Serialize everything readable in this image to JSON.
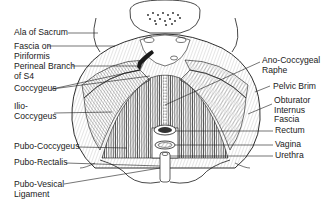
{
  "diagram": {
    "colors": {
      "ink": "#1a1a1a",
      "background": "#ffffff",
      "muscle_fill": "#e6e6e6",
      "skin_fill": "#f7f7f7"
    },
    "labels_left": [
      {
        "id": "ala-of-sacrum",
        "line1": "Ala of Sacrum",
        "line2": ""
      },
      {
        "id": "fascia-on-piriformis",
        "line1": "Fascia on",
        "line2": "Piriformis"
      },
      {
        "id": "perineal-branch-s4",
        "line1": "Perineal Branch",
        "line2": "of S4"
      },
      {
        "id": "coccygeus",
        "line1": "Coccygeus",
        "line2": ""
      },
      {
        "id": "ilio-coccygeus",
        "line1": "Ilio-",
        "line2": "Coccygeus"
      },
      {
        "id": "pubo-coccygeus",
        "line1": "Pubo-Coccygeus",
        "line2": ""
      },
      {
        "id": "pubo-rectalis",
        "line1": "Pubo-Rectalis",
        "line2": ""
      },
      {
        "id": "pubo-vesical-ligament",
        "line1": "Pubo-Vesical",
        "line2": "Ligament"
      }
    ],
    "labels_right": [
      {
        "id": "ano-coccygeal-raphe",
        "line1": "Ano-Coccygeal",
        "line2": "Raphe"
      },
      {
        "id": "pelvic-brim",
        "line1": "Pelvic Brim",
        "line2": ""
      },
      {
        "id": "obturator-internus-fascia",
        "line1": "Obturator",
        "line2": "Internus",
        "line3": "Fascia"
      },
      {
        "id": "rectum",
        "line1": "Rectum",
        "line2": ""
      },
      {
        "id": "vagina",
        "line1": "Vagina",
        "line2": ""
      },
      {
        "id": "urethra",
        "line1": "Urethra",
        "line2": ""
      }
    ]
  }
}
